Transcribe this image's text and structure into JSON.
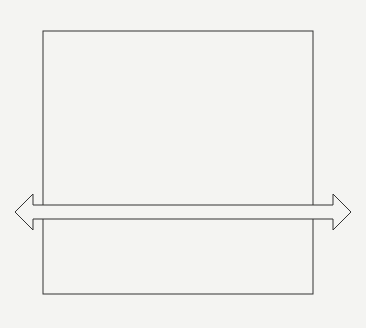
{
  "header_fragment": "page 33, 1996.",
  "diagram": {
    "departments": [
      {
        "lines": [
          "Marketing"
        ]
      },
      {
        "lines": [
          "Engineering"
        ]
      },
      {
        "lines": [
          "Purchasing"
        ]
      },
      {
        "lines": [
          "Manufacturing engineering"
        ]
      },
      {
        "lines": [
          "Manufacturing supervision",
          "and shop operations"
        ]
      },
      {
        "lines": [
          "Mechanical inspection",
          "and functional test"
        ]
      },
      {
        "lines": [
          "Shipping"
        ]
      },
      {
        "lines": [
          "Installation and service"
        ]
      }
    ],
    "horizontal_arrow_label": "Total quality control",
    "left_label": "Customer",
    "right_label": "Customer",
    "bottom_label": "Vertical organizational responsibility",
    "colors": {
      "line": "#333333",
      "background": "#f4f4f2"
    }
  }
}
